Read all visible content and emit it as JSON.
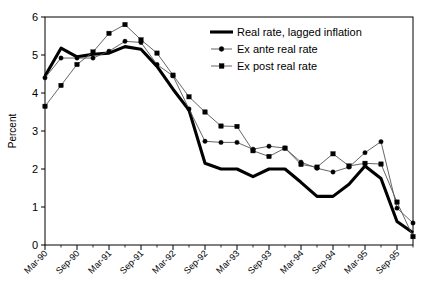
{
  "chart_data": {
    "type": "line",
    "title": "",
    "xlabel": "",
    "ylabel": "Percent",
    "ylim": [
      0,
      6
    ],
    "ytick_values": [
      0,
      1,
      2,
      3,
      4,
      5,
      6
    ],
    "ytick_labels": [
      "0",
      "1",
      "2",
      "3",
      "4",
      "5",
      "6"
    ],
    "grid": false,
    "legend_position": "top-right",
    "x": [
      "Mar-90",
      "Jun-90",
      "Sep-90",
      "Dec-90",
      "Mar-91",
      "Jun-91",
      "Sep-91",
      "Dec-91",
      "Mar-92",
      "Jun-92",
      "Sep-92",
      "Dec-92",
      "Mar-93",
      "Jun-93",
      "Sep-93",
      "Dec-93",
      "Mar-94",
      "Jun-94",
      "Sep-94",
      "Dec-94",
      "Mar-95",
      "Jun-95",
      "Sep-95",
      "Dec-95"
    ],
    "xtick_labels": [
      "Mar-90",
      "Sep-90",
      "Mar-91",
      "Sep-91",
      "Mar-92",
      "Sep-92",
      "Mar-93",
      "Sep-93",
      "Mar-94",
      "Sep-94",
      "Mar-95",
      "Sep-95"
    ],
    "series": [
      {
        "name": "Real rate, lagged inflation",
        "marker": "none",
        "line_width": "thick",
        "color": "#000000",
        "values": [
          4.45,
          5.18,
          4.95,
          5.02,
          5.05,
          5.22,
          5.15,
          4.7,
          4.1,
          3.55,
          2.15,
          2.0,
          2.0,
          1.8,
          2.0,
          2.0,
          1.65,
          1.28,
          1.28,
          1.6,
          2.08,
          1.75,
          0.62,
          0.32
        ]
      },
      {
        "name": "Ex ante real rate",
        "marker": "circle",
        "line_width": "thin",
        "color": "#333333",
        "values": [
          4.4,
          4.92,
          4.92,
          4.92,
          5.1,
          5.36,
          5.33,
          4.75,
          4.45,
          3.58,
          2.73,
          2.7,
          2.7,
          2.52,
          2.6,
          2.55,
          2.18,
          2.02,
          1.92,
          2.05,
          2.43,
          2.72,
          0.97,
          0.58
        ]
      },
      {
        "name": "Ex post real rate",
        "marker": "square",
        "line_width": "thin",
        "color": "#333333",
        "values": [
          3.65,
          4.2,
          4.75,
          5.08,
          5.57,
          5.8,
          5.4,
          5.05,
          4.47,
          3.9,
          3.5,
          3.13,
          3.12,
          2.48,
          2.33,
          2.55,
          2.12,
          2.05,
          2.4,
          2.08,
          2.15,
          2.13,
          1.13,
          0.22
        ]
      }
    ]
  },
  "legend": {
    "items": [
      {
        "label": "Real rate, lagged inflation"
      },
      {
        "label": "Ex ante real rate"
      },
      {
        "label": "Ex post real rate"
      }
    ]
  }
}
